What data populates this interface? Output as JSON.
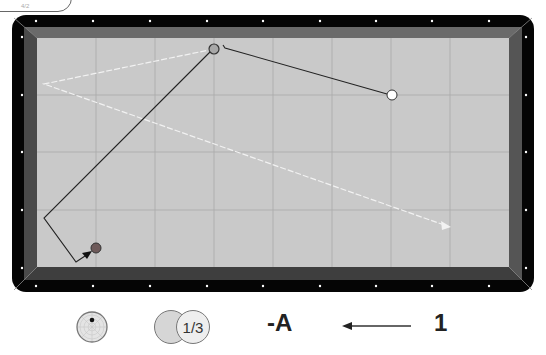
{
  "header": {
    "tag_label": "4/2"
  },
  "table": {
    "rail_color": "#050505",
    "cushion_color": "#5e5e5e",
    "cloth_color": "#c9c9c9",
    "grid_color": "#a9a9a9",
    "diamond_color": "#ffffff",
    "balls": [
      {
        "name": "object-ball-grey",
        "x": 214,
        "y": 49,
        "fill": "#a8a8a8",
        "stroke": "#333333"
      },
      {
        "name": "object-ball-white",
        "x": 392,
        "y": 95,
        "fill": "#ffffff",
        "stroke": "#333333"
      },
      {
        "name": "cue-ball",
        "x": 96,
        "y": 248,
        "fill": "#6e5a5a",
        "stroke": "#333333"
      }
    ]
  },
  "controls": {
    "spin_icon": "cue-tip-spin-icon",
    "thickness_label": "1/3",
    "system_label": "-A",
    "arrow_icon": "arrow-left-icon",
    "number_label": "1"
  }
}
